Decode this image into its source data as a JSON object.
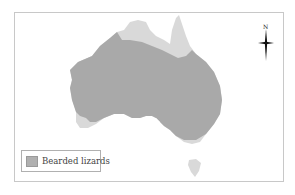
{
  "map": {
    "title": "",
    "region": "Australia",
    "colors": {
      "range_fill": "#a9a9a9",
      "other_land_fill": "#d9d9d9",
      "frame": "#c8c8c8",
      "background": "#ffffff"
    }
  },
  "legend": {
    "items": [
      {
        "label": "Bearded lizards",
        "swatch_color": "#b0b0b0"
      }
    ]
  },
  "compass": {
    "label": "N"
  }
}
